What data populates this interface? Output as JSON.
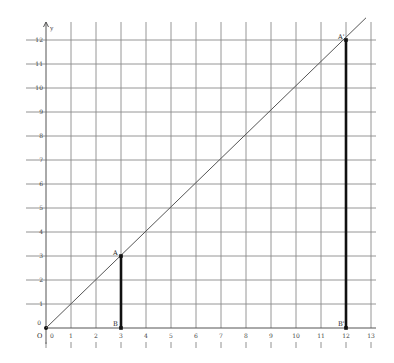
{
  "chart_data": {
    "type": "line",
    "title": "",
    "xlabel": "",
    "ylabel": "y",
    "xlim": [
      0,
      13
    ],
    "ylim": [
      0,
      12
    ],
    "grid": true,
    "x_ticks": [
      "0",
      "1",
      "2",
      "3",
      "4",
      "5",
      "6",
      "7",
      "8",
      "9",
      "10",
      "11",
      "12",
      "13"
    ],
    "y_ticks": [
      "0",
      "1",
      "2",
      "3",
      "4",
      "5",
      "6",
      "7",
      "8",
      "9",
      "10",
      "11",
      "12"
    ],
    "origin_label": "O",
    "line": {
      "name": "y = x",
      "from": [
        0,
        0
      ],
      "to": [
        13,
        13.4
      ]
    },
    "segments": [
      {
        "name": "AB",
        "from_label": "A",
        "to_label": "B",
        "from": [
          3,
          3
        ],
        "to": [
          3,
          0
        ]
      },
      {
        "name": "A'B'",
        "from_label": "A'",
        "to_label": "B'",
        "from": [
          12,
          12
        ],
        "to": [
          12,
          0
        ]
      }
    ],
    "points": [
      {
        "label": "A",
        "x": 3,
        "y": 3
      },
      {
        "label": "B",
        "x": 3,
        "y": 0
      },
      {
        "label": "A'",
        "x": 12,
        "y": 12
      },
      {
        "label": "B'",
        "x": 12,
        "y": 0
      },
      {
        "label": "O",
        "x": 0,
        "y": 0
      }
    ]
  },
  "colors": {
    "grid": "#8a8a8a",
    "segment": "#111111",
    "line": "#555555"
  }
}
